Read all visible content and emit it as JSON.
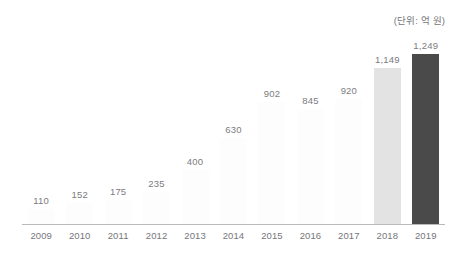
{
  "unit_caption": "(단위: 억 원)",
  "colors": {
    "faint_bar": "#fdfdfd",
    "light_bar": "#e3e3e3",
    "dark_bar": "#4a4a4a",
    "axis_line": "#b9b9bc",
    "label_text": "#76767a",
    "value_text": "#7c7c80",
    "background": "#ffffff"
  },
  "chart_data": {
    "type": "bar",
    "title": "",
    "subtitle": "",
    "xlabel": "",
    "ylabel": "",
    "unit": "(단위: 억 원)",
    "grid": false,
    "legend": false,
    "ylim": [
      0,
      1400
    ],
    "categories": [
      "2009",
      "2010",
      "2011",
      "2012",
      "2013",
      "2014",
      "2015",
      "2016",
      "2017",
      "2018",
      "2019"
    ],
    "values": [
      110,
      152,
      175,
      235,
      400,
      630,
      902,
      845,
      920,
      1149,
      1249
    ],
    "value_labels": [
      "110",
      "152",
      "175",
      "235",
      "400",
      "630",
      "902",
      "845",
      "920",
      "1,149",
      "1,249"
    ],
    "bar_colors": [
      "#fdfdfd",
      "#fdfdfd",
      "#fdfdfd",
      "#fdfdfd",
      "#fdfdfd",
      "#fdfdfd",
      "#fdfdfd",
      "#fdfdfd",
      "#fdfdfd",
      "#e3e3e3",
      "#4a4a4a"
    ]
  }
}
